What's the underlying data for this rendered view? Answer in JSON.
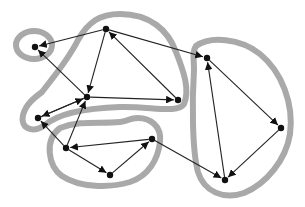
{
  "diagram": {
    "type": "directed-graph",
    "colors": {
      "component_outline": "#a9a9a9",
      "edge": "#222222",
      "node": "#111111",
      "background": "#ffffff"
    },
    "nodes": [
      {
        "id": "a",
        "x": 35,
        "y": 47
      },
      {
        "id": "b",
        "x": 106,
        "y": 29
      },
      {
        "id": "c",
        "x": 87,
        "y": 97
      },
      {
        "id": "d",
        "x": 178,
        "y": 100
      },
      {
        "id": "e",
        "x": 38,
        "y": 118
      },
      {
        "id": "f",
        "x": 66,
        "y": 148
      },
      {
        "id": "g",
        "x": 110,
        "y": 175
      },
      {
        "id": "h",
        "x": 152,
        "y": 139
      },
      {
        "id": "i",
        "x": 207,
        "y": 58
      },
      {
        "id": "j",
        "x": 281,
        "y": 128
      },
      {
        "id": "k",
        "x": 225,
        "y": 180
      }
    ],
    "edges": [
      {
        "from": "b",
        "to": "a"
      },
      {
        "from": "c",
        "to": "a"
      },
      {
        "from": "b",
        "to": "c"
      },
      {
        "from": "d",
        "to": "b"
      },
      {
        "from": "c",
        "to": "d"
      },
      {
        "from": "b",
        "to": "i"
      },
      {
        "from": "c",
        "to": "e"
      },
      {
        "from": "e",
        "to": "c"
      },
      {
        "from": "f",
        "to": "e"
      },
      {
        "from": "f",
        "to": "c"
      },
      {
        "from": "h",
        "to": "f"
      },
      {
        "from": "f",
        "to": "g"
      },
      {
        "from": "g",
        "to": "h"
      },
      {
        "from": "h",
        "to": "k"
      },
      {
        "from": "i",
        "to": "j"
      },
      {
        "from": "j",
        "to": "k"
      },
      {
        "from": "k",
        "to": "i"
      }
    ],
    "components": [
      {
        "id": "scc-1",
        "members": [
          "a"
        ]
      },
      {
        "id": "scc-2",
        "members": [
          "b",
          "c",
          "d",
          "e"
        ]
      },
      {
        "id": "scc-3",
        "members": [
          "f",
          "g",
          "h"
        ]
      },
      {
        "id": "scc-4",
        "members": [
          "i",
          "j",
          "k"
        ]
      }
    ]
  }
}
